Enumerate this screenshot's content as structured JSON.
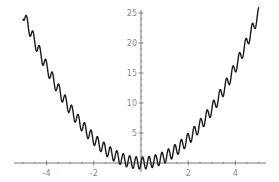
{
  "chart_data": {
    "type": "line",
    "title": "",
    "xlabel": "",
    "ylabel": "",
    "function": "x^2 + sin(23 x)",
    "xlim": [
      -5.3,
      5.3
    ],
    "ylim": [
      -1.5,
      25.5
    ],
    "grid": false,
    "legend": null,
    "x_ticks": [
      -4,
      -2,
      2,
      4
    ],
    "x_tick_labels": [
      "-4",
      "-2",
      "2",
      "4"
    ],
    "y_ticks": [
      5,
      10,
      15,
      20,
      25
    ],
    "y_tick_labels": [
      "5",
      "10",
      "15",
      "20",
      "25"
    ],
    "series": [
      {
        "name": "f(x)",
        "color": "#1a1a1a",
        "x_range": [
          -5,
          5
        ],
        "amplitude": 1,
        "frequency": 23,
        "sample_x": [
          -5,
          -4,
          -3,
          -2,
          -1,
          0,
          1,
          2,
          3,
          4,
          5
        ],
        "sample_y": [
          24.1,
          15.6,
          9.2,
          4.1,
          0.2,
          0.0,
          1.8,
          3.9,
          8.8,
          16.4,
          25.9
        ]
      }
    ]
  },
  "axes": {
    "color": "#555555",
    "label_color": "#8a8a8a"
  }
}
